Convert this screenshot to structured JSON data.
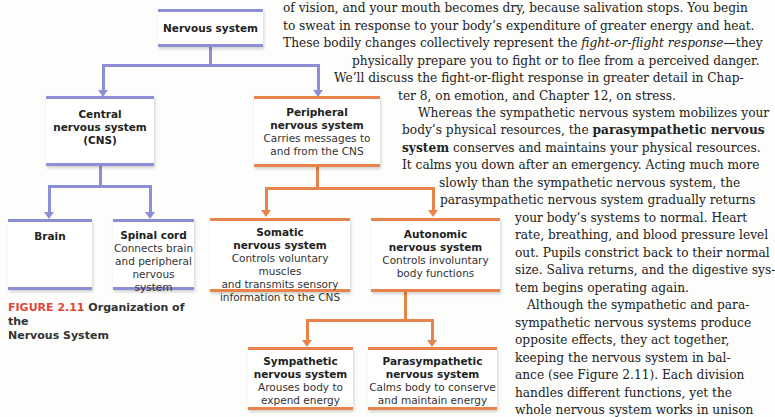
{
  "diagram": {
    "root": {
      "title": "Nervous system"
    },
    "cns": {
      "title_line1": "Central",
      "title_line2": "nervous system",
      "title_line3": "(CNS)"
    },
    "pns": {
      "title_line1": "Peripheral",
      "title_line2": "nervous system",
      "desc_line1": "Carries messages to",
      "desc_line2": "and from the CNS"
    },
    "brain": {
      "title": "Brain"
    },
    "spinal_cord": {
      "title": "Spinal cord",
      "desc_line1": "Connects brain",
      "desc_line2": "and peripheral",
      "desc_line3": "nervous system"
    },
    "somatic": {
      "title_line1": "Somatic",
      "title_line2": "nervous system",
      "desc_line1": "Controls voluntary muscles",
      "desc_line2": "and transmits sensory",
      "desc_line3": "information to the CNS"
    },
    "autonomic": {
      "title_line1": "Autonomic",
      "title_line2": "nervous system",
      "desc_line1": "Controls involuntary",
      "desc_line2": "body functions"
    },
    "sympathetic": {
      "title_line1": "Sympathetic",
      "title_line2": "nervous system",
      "desc_line1": "Arouses body to",
      "desc_line2": "expend energy"
    },
    "parasympathetic": {
      "title_line1": "Parasympathetic",
      "title_line2": "nervous system",
      "desc_line1": "Calms body to conserve",
      "desc_line2": "and maintain energy"
    },
    "colors": {
      "cns_branch": "#8d8fd6",
      "pns_branch": "#e8834a",
      "figure_label": "#e0463a"
    }
  },
  "caption": {
    "figure_label": "FIGURE 2.11",
    "text_line1": " Organization of the",
    "text_line2": "Nervous System"
  },
  "body_text": {
    "lines": [
      "of vision, and your mouth becomes dry, because salivation stops. You begin",
      "to sweat in response to your body’s expenditure of greater energy and heat.",
      "physically prepare you to fight or to flee from a perceived danger.",
      "We’ll discuss the fight-or-flight response in greater detail in Chap-",
      "ter 8, on emotion, and Chapter 12, on stress.",
      "Whereas the sympathetic nervous system mobilizes your",
      "body’s physical resources, the",
      "conserves and maintains your physical resources.",
      "It calms you down after an emergency. Acting much more",
      "slowly than the sympathetic nervous system, the",
      "parasympathetic nervous system gradually returns",
      "your body’s systems to normal. Heart",
      "rate, breathing, and blood pressure level",
      "out. Pupils constrict back to their normal",
      "size. Saliva returns, and the digestive sys-",
      "tem begins operating again.",
      "Although the sympathetic and para-",
      "sympathetic nervous systems produce",
      "opposite effects, they act together,",
      "keeping the nervous system in bal-",
      "ance (see Figure 2.11). Each division",
      "handles different functions, yet the",
      "whole nervous system works in unison",
      "so that both automatic and voluntary",
      "behaviors are carried out smoothly."
    ],
    "line3_prefix": "These bodily changes collectively represent the ",
    "line3_italic": "fight-or-flight response",
    "line3_suffix": "—they",
    "bold_term_part1": "parasympathetic nervous",
    "bold_term_part2": "system"
  }
}
